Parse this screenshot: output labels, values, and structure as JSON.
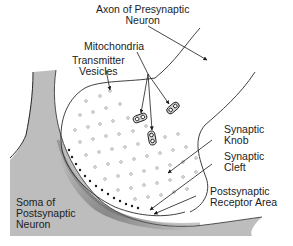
{
  "diagram": {
    "labels": {
      "axon": [
        "Axon of Presynaptic",
        "Neuron"
      ],
      "mitochondria": "Mitochondria",
      "vesicles": [
        "Transmitter",
        "Vesicles"
      ],
      "synaptic_knob": [
        "Synaptic",
        "Knob"
      ],
      "synaptic_cleft": [
        "Synaptic",
        "Cleft"
      ],
      "receptor_area": [
        "Postsynaptic",
        "Receptor Area"
      ],
      "soma": [
        "Soma of",
        "Postsynaptic",
        "Neuron"
      ]
    },
    "colors": {
      "line": "#2a2a2a",
      "soma_fill": "#b8b8b8",
      "soma_shadow": "#6a6a6a",
      "vesicle": "#a8a8a8",
      "background": "#ffffff"
    }
  }
}
